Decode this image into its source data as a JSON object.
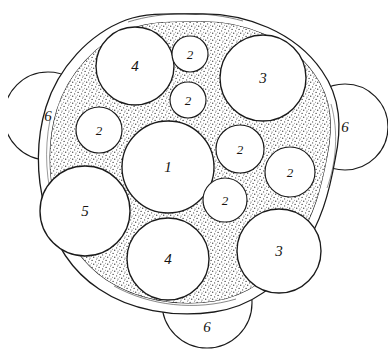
{
  "figure": {
    "background_color": "#ffffff",
    "ink_color": "#1a1a1a",
    "stipple_color": "#3a3a3a",
    "circle_fill": "#ffffff",
    "style": "hand-drawn line art with stippled matrix"
  },
  "boundary": {
    "name": "outer-wall",
    "description": "double-line capsule wall enclosing the packed circles",
    "stroke_color": "#1a1a1a",
    "inner_fill_name": "stippled-matrix"
  },
  "circles": [
    {
      "id": "c1",
      "label": "1",
      "cx": 168,
      "cy": 167,
      "r": 46,
      "group": "inner",
      "size_class": "large"
    },
    {
      "id": "c2",
      "label": "4",
      "cx": 135,
      "cy": 66,
      "r": 39,
      "group": "inner",
      "size_class": "large"
    },
    {
      "id": "c3",
      "label": "3",
      "cx": 263,
      "cy": 78,
      "r": 43,
      "group": "inner",
      "size_class": "large"
    },
    {
      "id": "c4",
      "label": "5",
      "cx": 85,
      "cy": 211,
      "r": 45,
      "group": "inner",
      "size_class": "large"
    },
    {
      "id": "c5",
      "label": "4",
      "cx": 168,
      "cy": 259,
      "r": 41,
      "group": "inner",
      "size_class": "large"
    },
    {
      "id": "c6",
      "label": "3",
      "cx": 279,
      "cy": 251,
      "r": 42,
      "group": "inner",
      "size_class": "large"
    },
    {
      "id": "c7",
      "label": "2",
      "cx": 190,
      "cy": 54,
      "r": 18,
      "group": "inner",
      "size_class": "small"
    },
    {
      "id": "c8",
      "label": "2",
      "cx": 188,
      "cy": 100,
      "r": 18,
      "group": "inner",
      "size_class": "small"
    },
    {
      "id": "c9",
      "label": "2",
      "cx": 99,
      "cy": 130,
      "r": 23,
      "group": "inner",
      "size_class": "small"
    },
    {
      "id": "c10",
      "label": "2",
      "cx": 240,
      "cy": 149,
      "r": 24,
      "group": "inner",
      "size_class": "small"
    },
    {
      "id": "c11",
      "label": "2",
      "cx": 290,
      "cy": 172,
      "r": 25,
      "group": "inner",
      "size_class": "small"
    },
    {
      "id": "c12",
      "label": "2",
      "cx": 225,
      "cy": 200,
      "r": 22,
      "group": "inner",
      "size_class": "small"
    },
    {
      "id": "c13",
      "label": "6",
      "cx": 48,
      "cy": 116,
      "r": 44,
      "group": "outer",
      "size_class": "large"
    },
    {
      "id": "c14",
      "label": "6",
      "cx": 345,
      "cy": 127,
      "r": 43,
      "group": "outer",
      "size_class": "large"
    },
    {
      "id": "c15",
      "label": "6",
      "cx": 207,
      "cy": 303,
      "r": 45,
      "group": "outer",
      "size_class": "large"
    }
  ],
  "label_positions": [
    {
      "for": "c1",
      "text": "1",
      "x": 168,
      "y": 167,
      "size": 15
    },
    {
      "for": "c2",
      "text": "4",
      "x": 135,
      "y": 66,
      "size": 15
    },
    {
      "for": "c3",
      "text": "3",
      "x": 263,
      "y": 78,
      "size": 15
    },
    {
      "for": "c4",
      "text": "5",
      "x": 85,
      "y": 211,
      "size": 15
    },
    {
      "for": "c5",
      "text": "4",
      "x": 168,
      "y": 259,
      "size": 15
    },
    {
      "for": "c6",
      "text": "3",
      "x": 279,
      "y": 251,
      "size": 15
    },
    {
      "for": "c7",
      "text": "2",
      "x": 190,
      "y": 54,
      "size": 13
    },
    {
      "for": "c8",
      "text": "2",
      "x": 188,
      "y": 100,
      "size": 13
    },
    {
      "for": "c9",
      "text": "2",
      "x": 99,
      "y": 130,
      "size": 13
    },
    {
      "for": "c10",
      "text": "2",
      "x": 240,
      "y": 149,
      "size": 13
    },
    {
      "for": "c11",
      "text": "2",
      "x": 290,
      "y": 172,
      "size": 13
    },
    {
      "for": "c12",
      "text": "2",
      "x": 225,
      "y": 200,
      "size": 13
    },
    {
      "for": "c13",
      "text": "6",
      "x": 48,
      "y": 116,
      "size": 15
    },
    {
      "for": "c14",
      "text": "6",
      "x": 345,
      "y": 127,
      "size": 15
    },
    {
      "for": "c15",
      "text": "6",
      "x": 207,
      "y": 327,
      "size": 15
    }
  ],
  "legend_key": {
    "1": "central large circle",
    "2": "small circles",
    "3": "right-side large circles",
    "4": "top and bottom large circles",
    "5": "left large circle",
    "6": "outer peripheral circles"
  }
}
